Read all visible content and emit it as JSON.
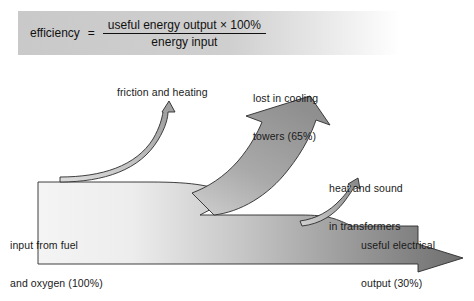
{
  "figure": {
    "type": "energy-flow-sankey-diagram",
    "background_color": "#ffffff",
    "text_color": "#1a1a1a"
  },
  "formula": {
    "label": "efficiency",
    "equals": "=",
    "numerator": "useful energy output × 100%",
    "denominator": "energy input",
    "box_fill_left": "#c9c9c9",
    "box_fill_right": "#ffffff"
  },
  "labels": {
    "friction": "friction and heating",
    "cooling_line1": "lost in cooling",
    "cooling_line2": "towers (65%)",
    "heat_line1": "heat and sound",
    "heat_line2": "in transformers",
    "input_line1": "input from fuel",
    "input_line2": "and oxygen (100%)",
    "output_line1": "useful electrical",
    "output_line2": "output (30%)"
  },
  "flows": [
    {
      "name": "input from fuel and oxygen",
      "percent": 100,
      "direction": "right"
    },
    {
      "name": "friction and heating",
      "percent": null,
      "direction": "up"
    },
    {
      "name": "lost in cooling towers",
      "percent": 65,
      "direction": "up-right"
    },
    {
      "name": "heat and sound in transformers",
      "percent": null,
      "direction": "up-right"
    },
    {
      "name": "useful electrical output",
      "percent": 30,
      "direction": "right"
    }
  ],
  "colors": {
    "band_light": "#f2f2f2",
    "band_mid": "#b8b8b8",
    "band_dark": "#6e6e6e",
    "arrow_fill": "#9a9a9a",
    "outline": "#2b2b2b"
  }
}
